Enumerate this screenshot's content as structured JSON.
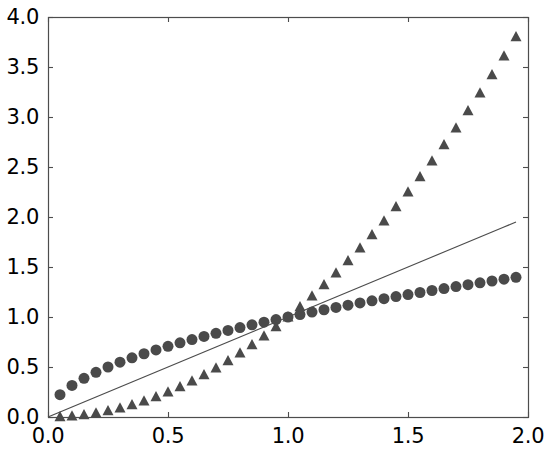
{
  "chart_data": {
    "type": "scatter",
    "title": "",
    "xlabel": "",
    "ylabel": "",
    "xlim": [
      0.0,
      2.0
    ],
    "ylim": [
      0.0,
      4.0
    ],
    "xticks": [
      "0.0",
      "0.5",
      "1.0",
      "1.5",
      "2.0"
    ],
    "xtick_values": [
      0.0,
      0.5,
      1.0,
      1.5,
      2.0
    ],
    "yticks": [
      "0.0",
      "0.5",
      "1.0",
      "1.5",
      "2.0",
      "2.5",
      "3.0",
      "3.5",
      "4.0"
    ],
    "ytick_values": [
      0.0,
      0.5,
      1.0,
      1.5,
      2.0,
      2.5,
      3.0,
      3.5,
      4.0
    ],
    "grid": false,
    "legend": "none",
    "background_color": "#ffffff",
    "axis_color": "#4d4d4d",
    "marker_color": "#4a4a4a",
    "line_color": "#4d4d4d",
    "x": [
      0.0,
      0.05,
      0.1,
      0.15,
      0.2,
      0.25,
      0.3,
      0.35,
      0.4,
      0.45,
      0.5,
      0.55,
      0.6,
      0.65,
      0.7,
      0.75,
      0.8,
      0.85,
      0.9,
      0.95,
      1.0,
      1.05,
      1.1,
      1.15,
      1.2,
      1.25,
      1.3,
      1.35,
      1.4,
      1.45,
      1.5,
      1.55,
      1.6,
      1.65,
      1.7,
      1.75,
      1.8,
      1.85,
      1.9,
      1.95
    ],
    "series": [
      {
        "name": "t**0.5",
        "marker": "circle",
        "style": "markers",
        "color": "#4a4a4a",
        "marker_size": 11,
        "start_index": 1,
        "values": [
          0.0,
          0.2236,
          0.3162,
          0.3873,
          0.4472,
          0.5,
          0.5477,
          0.5916,
          0.6325,
          0.6708,
          0.7071,
          0.7416,
          0.7746,
          0.8062,
          0.8367,
          0.866,
          0.8944,
          0.922,
          0.9487,
          0.9747,
          1.0,
          1.0247,
          1.0488,
          1.0724,
          1.0954,
          1.118,
          1.1402,
          1.1619,
          1.1832,
          1.2042,
          1.2247,
          1.245,
          1.2649,
          1.2845,
          1.3038,
          1.3229,
          1.3416,
          1.3601,
          1.3784,
          1.3964
        ]
      },
      {
        "name": "t",
        "marker": "none",
        "style": "line",
        "color": "#4d4d4d",
        "line_width": 1.2,
        "start_index": 0,
        "values": [
          0.0,
          0.05,
          0.1,
          0.15,
          0.2,
          0.25,
          0.3,
          0.35,
          0.4,
          0.45,
          0.5,
          0.55,
          0.6,
          0.65,
          0.7,
          0.75,
          0.8,
          0.85,
          0.9,
          0.95,
          1.0,
          1.05,
          1.1,
          1.15,
          1.2,
          1.25,
          1.3,
          1.35,
          1.4,
          1.45,
          1.5,
          1.55,
          1.6,
          1.65,
          1.7,
          1.75,
          1.8,
          1.85,
          1.9,
          1.95
        ]
      },
      {
        "name": "t**2",
        "marker": "triangle",
        "style": "markers",
        "color": "#4a4a4a",
        "marker_size": 11,
        "start_index": 1,
        "values": [
          0.0,
          0.0025,
          0.01,
          0.0225,
          0.04,
          0.0625,
          0.09,
          0.1225,
          0.16,
          0.2025,
          0.25,
          0.3025,
          0.36,
          0.4225,
          0.49,
          0.5625,
          0.64,
          0.7225,
          0.81,
          0.9025,
          1.0,
          1.1025,
          1.21,
          1.3225,
          1.44,
          1.5625,
          1.69,
          1.8225,
          1.96,
          2.1025,
          2.25,
          2.4025,
          2.56,
          2.7225,
          2.89,
          3.0625,
          3.24,
          3.4225,
          3.61,
          3.8025
        ]
      }
    ]
  },
  "plot_geometry": {
    "left": 48,
    "top": 17,
    "right": 528,
    "bottom": 417
  }
}
